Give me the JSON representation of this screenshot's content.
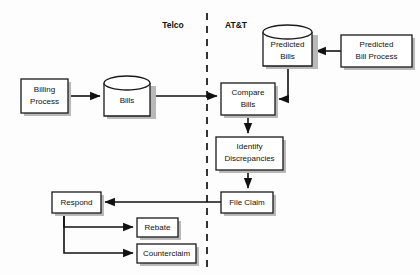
{
  "diagram": {
    "type": "flowchart",
    "background_color": "#fdfdfd",
    "line_color": "#111111",
    "box_fill": "#ffffff",
    "shadow_color": "#b9b9b9",
    "swimlanes": [
      {
        "id": "telco",
        "label": "Telco",
        "label_x": 173,
        "label_y": 26
      },
      {
        "id": "att",
        "label": "AT&T",
        "label_x": 236,
        "label_y": 26
      }
    ],
    "divider": {
      "name": "swimlane-divider",
      "x": 207,
      "y_top": 13,
      "y_bottom": 268,
      "style": "dashed"
    },
    "nodes": [
      {
        "id": "billing-process",
        "label_lines": [
          "Billing",
          "Process"
        ],
        "shape": "rect",
        "lane": "telco",
        "x": 21,
        "y": 79,
        "w": 47,
        "h": 34
      },
      {
        "id": "bills",
        "label_lines": [
          "Bills"
        ],
        "shape": "cylinder",
        "lane": "telco",
        "x": 104,
        "y": 76,
        "w": 46,
        "h": 40
      },
      {
        "id": "compare-bills",
        "label_lines": [
          "Compare",
          "Bills"
        ],
        "shape": "rect",
        "lane": "att",
        "x": 221,
        "y": 83,
        "w": 54,
        "h": 32
      },
      {
        "id": "predicted-bills",
        "label_lines": [
          "Predicted",
          "Bills"
        ],
        "shape": "cylinder",
        "lane": "att",
        "x": 263,
        "y": 25,
        "w": 49,
        "h": 41
      },
      {
        "id": "predicted-bill-process",
        "label_lines": [
          "Predicted",
          "Bill Process"
        ],
        "shape": "rect",
        "lane": "att",
        "x": 341,
        "y": 35,
        "w": 71,
        "h": 32
      },
      {
        "id": "identify-discrepancies",
        "label_lines": [
          "Identify",
          "Discrepancies"
        ],
        "shape": "rect",
        "lane": "att",
        "x": 216,
        "y": 137,
        "w": 67,
        "h": 33
      },
      {
        "id": "file-claim",
        "label_lines": [
          "File Claim"
        ],
        "shape": "rect",
        "lane": "att",
        "x": 221,
        "y": 192,
        "w": 52,
        "h": 21
      },
      {
        "id": "respond",
        "label_lines": [
          "Respond"
        ],
        "shape": "rect",
        "lane": "telco",
        "x": 52,
        "y": 192,
        "w": 49,
        "h": 21
      },
      {
        "id": "rebate",
        "label_lines": [
          "Rebate"
        ],
        "shape": "rect",
        "lane": "telco",
        "x": 137,
        "y": 218,
        "w": 41,
        "h": 19
      },
      {
        "id": "counterclaim",
        "label_lines": [
          "Counterclaim"
        ],
        "shape": "rect",
        "lane": "telco",
        "x": 137,
        "y": 244,
        "w": 59,
        "h": 19
      }
    ],
    "edges": [
      {
        "id": "billing-to-bills",
        "from": "billing-process",
        "to": "bills",
        "arrow": true
      },
      {
        "id": "bills-to-compare",
        "from": "bills",
        "to": "compare-bills",
        "arrow": true
      },
      {
        "id": "predictedproc-to-predictedbills",
        "from": "predicted-bill-process",
        "to": "predicted-bills",
        "arrow": true
      },
      {
        "id": "predictedbills-to-compare",
        "from": "predicted-bills",
        "to": "compare-bills",
        "arrow": true
      },
      {
        "id": "compare-to-identify",
        "from": "compare-bills",
        "to": "identify-discrepancies",
        "arrow": true
      },
      {
        "id": "identify-to-fileclaim",
        "from": "identify-discrepancies",
        "to": "file-claim",
        "arrow": true
      },
      {
        "id": "fileclaim-to-respond",
        "from": "file-claim",
        "to": "respond",
        "arrow": true
      },
      {
        "id": "respond-to-rebate",
        "from": "respond",
        "to": "rebate",
        "arrow": true
      },
      {
        "id": "respond-to-counterclaim",
        "from": "respond",
        "to": "counterclaim",
        "arrow": true
      }
    ]
  }
}
